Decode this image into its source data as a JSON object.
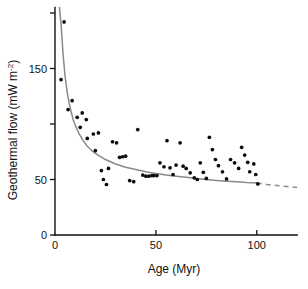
{
  "chart_data": {
    "type": "scatter",
    "title": "",
    "xlabel": "Age (Myr)",
    "ylabel": "Geothermal flow (mW m-2)",
    "ylabel_parts": {
      "main": "Geothermal flow (mW m",
      "superscript": "-2",
      "close": ")"
    },
    "xlim": [
      0,
      120
    ],
    "ylim": [
      0,
      210
    ],
    "grid": false,
    "legend": null,
    "xticks": [
      0,
      50,
      100
    ],
    "xticklabels": [
      "0",
      "50",
      "100"
    ],
    "yticks": [
      0,
      50,
      100,
      150,
      200
    ],
    "yticklabels": [
      "0",
      "50",
      "",
      "150",
      ""
    ],
    "axis_extent": {
      "x_axis_max": 120,
      "y_axis_max": 205
    },
    "series": [
      {
        "name": "Heat flow measurements",
        "type": "scatter",
        "marker": "filled-circle",
        "color": "#0d0d0d",
        "points": [
          [
            3.0,
            140.0
          ],
          [
            4.5,
            192.0
          ],
          [
            6.5,
            113.0
          ],
          [
            8.5,
            121.0
          ],
          [
            11.0,
            106.0
          ],
          [
            12.5,
            97.0
          ],
          [
            13.5,
            110.0
          ],
          [
            15.5,
            104.0
          ],
          [
            16.0,
            87.0
          ],
          [
            19.0,
            91.0
          ],
          [
            20.0,
            76.0
          ],
          [
            21.5,
            92.0
          ],
          [
            23.0,
            58.0
          ],
          [
            24.0,
            50.0
          ],
          [
            25.5,
            45.5
          ],
          [
            26.5,
            60.0
          ],
          [
            28.5,
            84.0
          ],
          [
            30.5,
            83.0
          ],
          [
            32.0,
            70.0
          ],
          [
            33.5,
            70.5
          ],
          [
            35.0,
            71.0
          ],
          [
            37.0,
            49.0
          ],
          [
            39.0,
            48.0
          ],
          [
            41.0,
            95.0
          ],
          [
            43.5,
            54.0
          ],
          [
            45.0,
            53.0
          ],
          [
            46.5,
            53.0
          ],
          [
            48.0,
            53.5
          ],
          [
            49.0,
            53.5
          ],
          [
            50.5,
            53.5
          ],
          [
            52.0,
            65.0
          ],
          [
            54.0,
            61.5
          ],
          [
            55.5,
            85.0
          ],
          [
            57.0,
            60.5
          ],
          [
            58.5,
            54.5
          ],
          [
            60.0,
            63.0
          ],
          [
            62.0,
            83.0
          ],
          [
            63.5,
            62.0
          ],
          [
            65.0,
            60.0
          ],
          [
            67.0,
            56.0
          ],
          [
            69.0,
            51.5
          ],
          [
            70.5,
            50.0
          ],
          [
            72.0,
            65.0
          ],
          [
            73.5,
            56.5
          ],
          [
            75.0,
            51.0
          ],
          [
            76.5,
            88.0
          ],
          [
            78.0,
            77.0
          ],
          [
            79.5,
            68.0
          ],
          [
            81.0,
            62.5
          ],
          [
            83.0,
            57.0
          ],
          [
            85.0,
            50.5
          ],
          [
            87.0,
            68.0
          ],
          [
            89.0,
            65.0
          ],
          [
            91.0,
            60.0
          ],
          [
            92.5,
            79.0
          ],
          [
            94.0,
            72.0
          ],
          [
            95.5,
            65.5
          ],
          [
            96.5,
            57.0
          ],
          [
            98.5,
            64.0
          ],
          [
            99.5,
            54.5
          ],
          [
            100.5,
            46.0
          ]
        ]
      },
      {
        "name": "Cooling model curve",
        "type": "line",
        "color": "#8a8a8a",
        "style_solid_range": [
          2.2,
          100.0
        ],
        "style_dashed_range": [
          100.0,
          120.0
        ],
        "model": "q = 480 / sqrt(t)",
        "points": [
          [
            2.2,
            205.0
          ],
          [
            3.0,
            190.0
          ],
          [
            4.0,
            163.0
          ],
          [
            5.0,
            143.0
          ],
          [
            6.0,
            129.0
          ],
          [
            7.0,
            119.0
          ],
          [
            8.0,
            111.0
          ],
          [
            9.0,
            104.0
          ],
          [
            10.0,
            99.0
          ],
          [
            12.0,
            91.0
          ],
          [
            14.0,
            85.0
          ],
          [
            16.0,
            80.0
          ],
          [
            18.0,
            76.5
          ],
          [
            20.0,
            73.5
          ],
          [
            25.0,
            68.0
          ],
          [
            30.0,
            64.0
          ],
          [
            35.0,
            61.0
          ],
          [
            40.0,
            59.0
          ],
          [
            45.0,
            57.0
          ],
          [
            50.0,
            55.5
          ],
          [
            55.0,
            54.0
          ],
          [
            60.0,
            53.0
          ],
          [
            65.0,
            52.0
          ],
          [
            70.0,
            51.0
          ],
          [
            75.0,
            50.0
          ],
          [
            80.0,
            49.2
          ],
          [
            85.0,
            48.5
          ],
          [
            90.0,
            48.0
          ],
          [
            95.0,
            47.3
          ],
          [
            100.0,
            46.8
          ],
          [
            105.0,
            45.5
          ],
          [
            110.0,
            44.5
          ],
          [
            115.0,
            43.6
          ],
          [
            120.0,
            42.8
          ]
        ]
      }
    ]
  }
}
